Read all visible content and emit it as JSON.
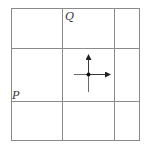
{
  "diagram": {
    "type": "grid",
    "rows": 3,
    "cols": 3,
    "labels": {
      "q": "Q",
      "p": "P"
    },
    "colors": {
      "grid": "#8a8a8a",
      "ink": "#222222",
      "background": "#ffffff"
    },
    "vector_field_point": {
      "arrows": [
        "up",
        "right"
      ],
      "stubs": [
        "left",
        "down"
      ]
    }
  }
}
